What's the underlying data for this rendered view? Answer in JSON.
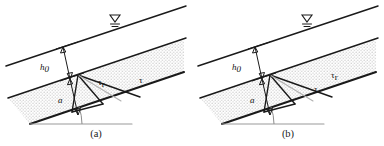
{
  "figure": {
    "panels": [
      {
        "id": "panel-a",
        "caption": "(a)",
        "labels": {
          "depth_upper": "h",
          "depth_upper_sub": "0",
          "depth_lower": "a",
          "shear_reduced": "τ",
          "shear_reduced_sub": "r",
          "shear": "τ"
        }
      },
      {
        "id": "panel-b",
        "caption": "(b)",
        "labels": {
          "depth_upper": "h",
          "depth_upper_sub": "0",
          "depth_lower": "a",
          "shear_reduced": "τ",
          "shear_reduced_sub": "r",
          "shear": "τ"
        }
      }
    ],
    "colors": {
      "line_dark": "#1a1a1a",
      "line_gray": "#9a9a9a",
      "vector_faint": "#b0b0b0",
      "stipple": "#8e8e8e",
      "background": "#ffffff"
    },
    "icons": {
      "free_surface": "free-surface-symbol",
      "angle_arc": "inclination-angle-arc"
    }
  }
}
